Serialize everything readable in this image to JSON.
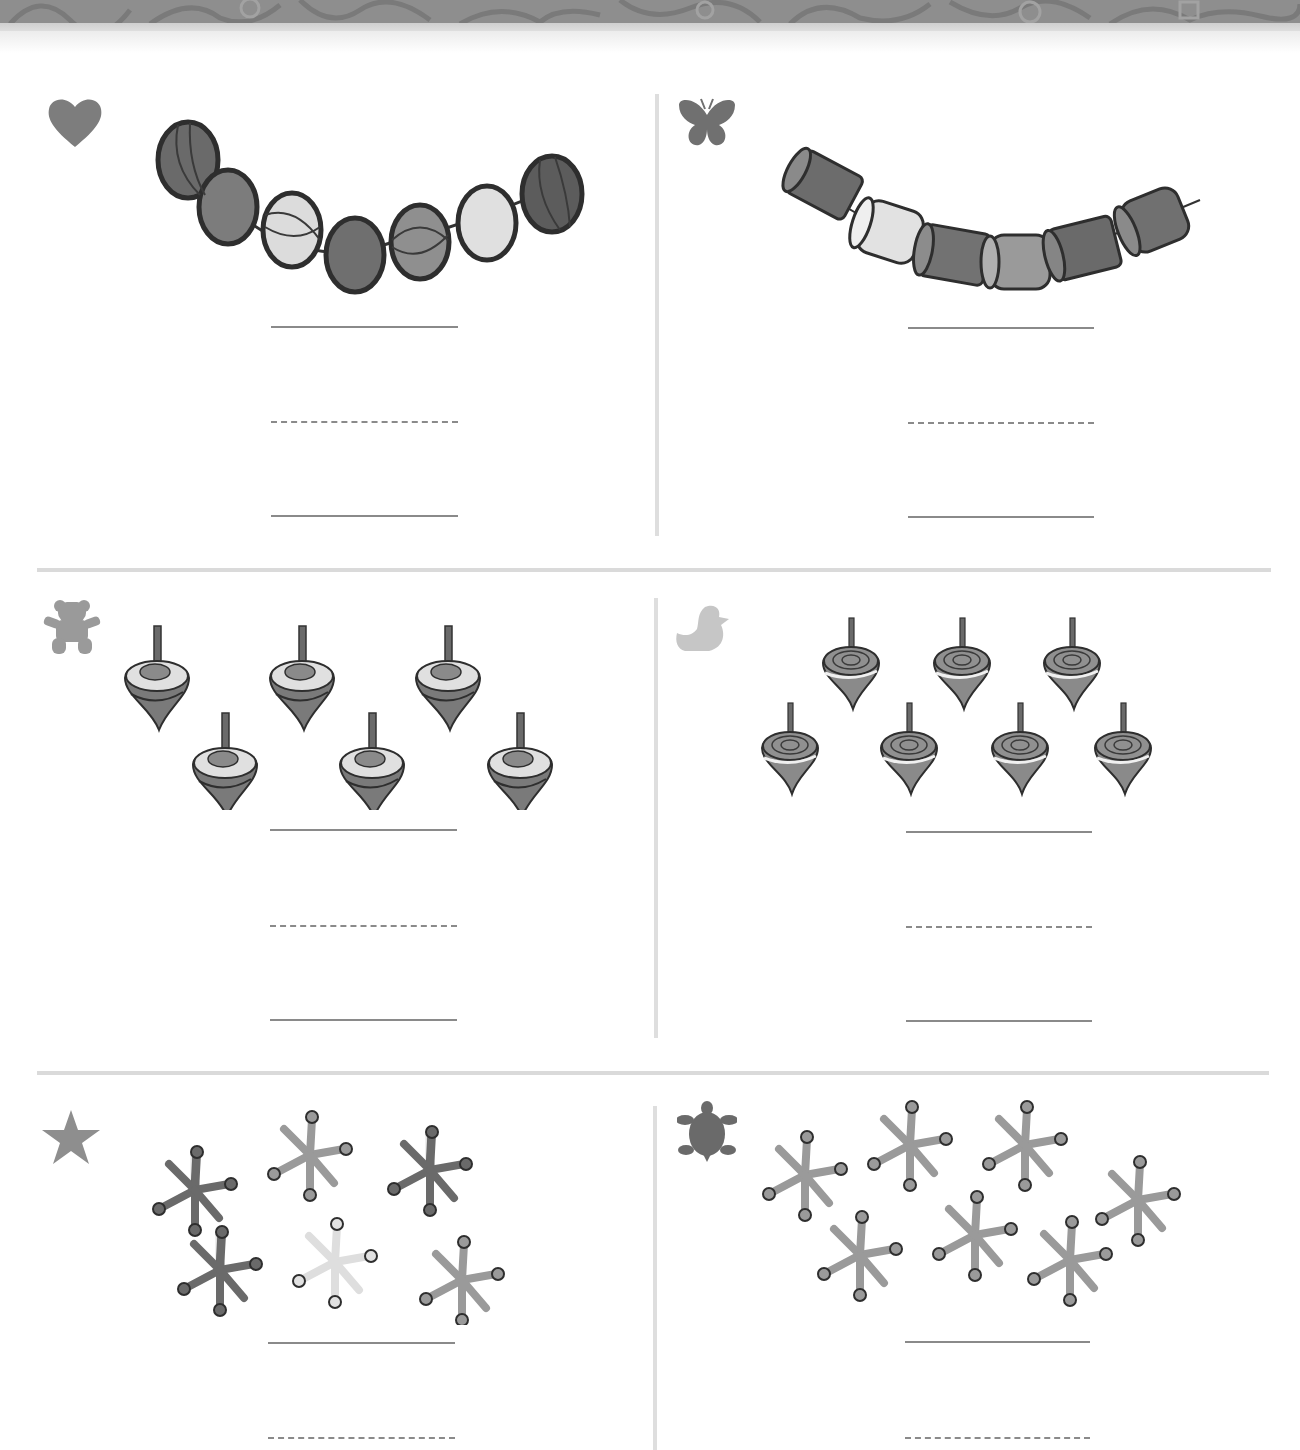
{
  "page": {
    "type": "counting worksheet",
    "colors": {
      "header_band": "#8e8e8e",
      "divider": "#dadada",
      "writing_line": "#8a8a8a",
      "object_dark": "#6e6e6e",
      "object_mid": "#8c8c8c",
      "object_light": "#d8d8d8"
    }
  },
  "exercises": [
    {
      "marker_icon": "heart-icon",
      "object": "round beads on a string",
      "count": 7,
      "answer_lines": [
        "solid",
        "dashed",
        "solid"
      ]
    },
    {
      "marker_icon": "butterfly-icon",
      "object": "barrel beads on a string",
      "count": 6,
      "answer_lines": [
        "solid",
        "dashed",
        "solid"
      ]
    },
    {
      "marker_icon": "teddy-bear-icon",
      "object": "spinning tops",
      "count": 6,
      "answer_lines": [
        "solid",
        "dashed",
        "solid"
      ]
    },
    {
      "marker_icon": "duck-icon",
      "object": "spinning tops",
      "count": 7,
      "answer_lines": [
        "solid",
        "dashed",
        "solid"
      ]
    },
    {
      "marker_icon": "star-icon",
      "object": "jacks",
      "count": 6,
      "answer_lines": [
        "solid",
        "dashed"
      ]
    },
    {
      "marker_icon": "turtle-icon",
      "object": "jacks",
      "count": 7,
      "answer_lines": [
        "solid",
        "dashed"
      ]
    }
  ]
}
